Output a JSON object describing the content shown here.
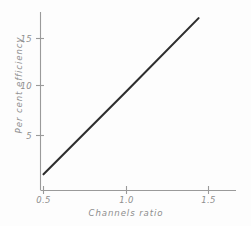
{
  "chart_data": {
    "type": "line",
    "title": "",
    "xlabel": "Channels ratio",
    "ylabel": "Per cent efficiency",
    "xlim": [
      0.4,
      1.62
    ],
    "ylim": [
      0,
      18.4
    ],
    "xticks": [
      0.5,
      1.0,
      1.5
    ],
    "xtick_labels": [
      "0.5",
      "1.0",
      "1.5"
    ],
    "yticks": [
      5,
      10,
      15
    ],
    "ytick_labels": [
      "5",
      "10",
      "15"
    ],
    "grid": false,
    "legend": null,
    "series": [
      {
        "name": "efficiency",
        "x": [
          0.5,
          1.0,
          1.44
        ],
        "values": [
          1.0,
          9.5,
          17.1
        ]
      }
    ],
    "colors": {
      "line": "#2e2e2e",
      "axis": "#9a9a9a",
      "text": "#8e8e8e",
      "background": "#fdfdfd"
    }
  },
  "labels": {
    "x_tick_0": "0.5",
    "x_tick_1": "1.0",
    "x_tick_2": "1.5",
    "y_tick_0": "5",
    "y_tick_1": "10",
    "y_tick_2": "15",
    "x_axis_title": "Channels ratio",
    "y_axis_title": "Per cent efficiency"
  }
}
